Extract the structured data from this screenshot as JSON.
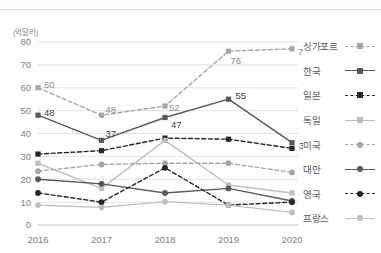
{
  "axis_unit_label": "(억달러)",
  "legend": {
    "items": [
      {
        "label": "싱가포르",
        "style": "dashed",
        "marker": "square",
        "color": "#a6a6a6"
      },
      {
        "label": "한국",
        "style": "solid",
        "marker": "square",
        "color": "#595959"
      },
      {
        "label": "일본",
        "style": "dashed",
        "marker": "square",
        "color": "#262626"
      },
      {
        "label": "독일",
        "style": "solid",
        "marker": "square",
        "color": "#bfbfbf"
      },
      {
        "label": "미국",
        "style": "dashed",
        "marker": "circle",
        "color": "#a6a6a6"
      },
      {
        "label": "대만",
        "style": "solid",
        "marker": "circle",
        "color": "#595959"
      },
      {
        "label": "영국",
        "style": "dashed",
        "marker": "circle",
        "color": "#262626"
      },
      {
        "label": "프랑스",
        "style": "solid",
        "marker": "circle",
        "color": "#bfbfbf"
      }
    ]
  },
  "chart_data": {
    "type": "line",
    "title": "",
    "xlabel": "",
    "ylabel": "(억달러)",
    "categories": [
      "2016",
      "2017",
      "2018",
      "2019",
      "2020"
    ],
    "ylim": [
      0,
      80
    ],
    "ytick_labels": [
      "0",
      "10",
      "20",
      "30",
      "40",
      "50",
      "60",
      "70",
      "80"
    ],
    "yticks": [
      0,
      10,
      20,
      30,
      40,
      50,
      60,
      70,
      80
    ],
    "grid": true,
    "legend_position": "right",
    "series": [
      {
        "name": "싱가포르",
        "values": [
          60,
          48,
          52,
          76,
          77
        ],
        "color": "#a6a6a6",
        "style": "dashed",
        "marker": "square",
        "labels": [
          "60",
          "48",
          "52",
          "76",
          "77"
        ]
      },
      {
        "name": "한국",
        "values": [
          48,
          37,
          47,
          55,
          36
        ],
        "color": "#595959",
        "style": "solid",
        "marker": "square",
        "labels": [
          "48",
          "37",
          "47",
          "55",
          "36"
        ]
      },
      {
        "name": "일본",
        "values": [
          31,
          32.5,
          38,
          37.5,
          33.5
        ],
        "color": "#262626",
        "style": "dashed",
        "marker": "square",
        "labels": [
          "",
          "",
          "",
          "",
          ""
        ]
      },
      {
        "name": "독일",
        "values": [
          27,
          16,
          37,
          17.5,
          14
        ],
        "color": "#bfbfbf",
        "style": "solid",
        "marker": "square",
        "labels": [
          "",
          "",
          "",
          "",
          ""
        ]
      },
      {
        "name": "미국",
        "values": [
          23.5,
          26.5,
          27,
          27,
          23
        ],
        "color": "#a6a6a6",
        "style": "dashed",
        "marker": "circle",
        "labels": [
          "",
          "",
          "",
          "",
          ""
        ]
      },
      {
        "name": "대만",
        "values": [
          20,
          18,
          14,
          16,
          10.5
        ],
        "color": "#595959",
        "style": "solid",
        "marker": "circle",
        "labels": [
          "",
          "",
          "",
          "",
          ""
        ]
      },
      {
        "name": "영국",
        "values": [
          14,
          10,
          25,
          8.7,
          10
        ],
        "color": "#262626",
        "style": "dashed",
        "marker": "circle",
        "labels": [
          "",
          "",
          "",
          "",
          ""
        ]
      },
      {
        "name": "프랑스",
        "values": [
          8.7,
          7.7,
          10.2,
          8.7,
          5.5
        ],
        "color": "#bfbfbf",
        "style": "solid",
        "marker": "circle",
        "labels": [
          "",
          "",
          "",
          "",
          ""
        ]
      }
    ],
    "annotations": [
      {
        "series": "싱가포르",
        "x": "2016",
        "value": 60,
        "text": "60"
      },
      {
        "series": "싱가포르",
        "x": "2017",
        "value": 48,
        "text": "48"
      },
      {
        "series": "싱가포르",
        "x": "2018",
        "value": 52,
        "text": "52"
      },
      {
        "series": "싱가포르",
        "x": "2019",
        "value": 76,
        "text": "76"
      },
      {
        "series": "싱가포르",
        "x": "2020",
        "value": 77,
        "text": "77"
      },
      {
        "series": "한국",
        "x": "2016",
        "value": 48,
        "text": "48"
      },
      {
        "series": "한국",
        "x": "2017",
        "value": 37,
        "text": "37"
      },
      {
        "series": "한국",
        "x": "2018",
        "value": 47,
        "text": "47"
      },
      {
        "series": "한국",
        "x": "2019",
        "value": 55,
        "text": "55"
      },
      {
        "series": "한국",
        "x": "2020",
        "value": 36,
        "text": "36"
      }
    ]
  }
}
